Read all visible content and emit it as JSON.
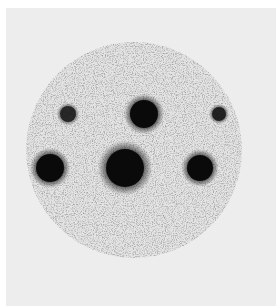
{
  "image": {
    "description": "Circular grayscale diffraction pattern with six dark spots arranged in two rows on a speckled background",
    "background_color": "#ededed",
    "plate_color": "#e4e4e4",
    "spot_color": "#0a0a0a",
    "plate": {
      "cx": 134,
      "cy": 150,
      "r": 108
    },
    "spots": [
      {
        "name": "spot-top-left",
        "cx": 68,
        "cy": 114,
        "r": 8,
        "intensity": 0.75
      },
      {
        "name": "spot-top-center",
        "cx": 144,
        "cy": 114,
        "r": 14,
        "intensity": 1.0
      },
      {
        "name": "spot-top-right",
        "cx": 219,
        "cy": 114,
        "r": 7,
        "intensity": 0.8
      },
      {
        "name": "spot-bottom-left",
        "cx": 50,
        "cy": 168,
        "r": 14,
        "intensity": 1.0
      },
      {
        "name": "spot-bottom-center",
        "cx": 125,
        "cy": 168,
        "r": 19,
        "intensity": 1.0
      },
      {
        "name": "spot-bottom-right",
        "cx": 200,
        "cy": 168,
        "r": 13,
        "intensity": 1.0
      }
    ]
  }
}
